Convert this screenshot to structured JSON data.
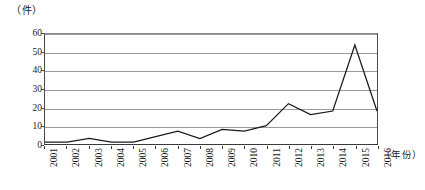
{
  "chart_data": {
    "type": "line",
    "title": "",
    "subtitle": "",
    "xlabel": "（年份）",
    "ylabel": "（件）",
    "ylim": [
      0,
      60
    ],
    "ytick_step": 10,
    "yticks": [
      "0",
      "10",
      "20",
      "30",
      "40",
      "50",
      "60"
    ],
    "grid": true,
    "legend": "none",
    "categories": [
      "2001",
      "2002",
      "2003",
      "2004",
      "2005",
      "2006",
      "2007",
      "2008",
      "2009",
      "2010",
      "2011",
      "2012",
      "2013",
      "2014",
      "2015",
      "2016"
    ],
    "values": [
      1,
      1,
      3,
      1,
      1,
      4,
      7,
      3,
      8,
      7,
      10,
      22,
      16,
      18,
      54,
      18
    ],
    "series": [
      {
        "name": "件数",
        "values": [
          1,
          1,
          3,
          1,
          1,
          4,
          7,
          3,
          8,
          7,
          10,
          22,
          16,
          18,
          54,
          18
        ]
      }
    ],
    "line_color": "#1a1a1a",
    "grid_color": "#9a9a9a",
    "axis_color": "#3a3a3a",
    "background_color": "#ffffff"
  }
}
